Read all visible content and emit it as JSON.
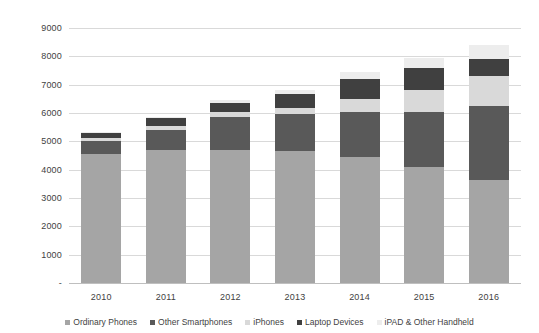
{
  "chart_data": {
    "type": "bar",
    "stacked": true,
    "title": "",
    "subtitle": "",
    "xlabel": "",
    "ylabel": "",
    "categories": [
      "2010",
      "2011",
      "2012",
      "2013",
      "2014",
      "2015",
      "2016"
    ],
    "ylim": [
      0,
      9000
    ],
    "yticks": [
      0,
      1000,
      2000,
      3000,
      4000,
      5000,
      6000,
      7000,
      8000,
      9000
    ],
    "ytick_labels": [
      "-",
      "1000",
      "2000",
      "3000",
      "4000",
      "5000",
      "6000",
      "7000",
      "8000",
      "9000"
    ],
    "grid": true,
    "legend_position": "bottom",
    "series": [
      {
        "name": "Ordinary Phones",
        "color": "#a5a5a5",
        "values": [
          4550,
          4700,
          4700,
          4650,
          4450,
          4100,
          3650
        ]
      },
      {
        "name": "Other Smartphones",
        "color": "#595959",
        "values": [
          450,
          700,
          1150,
          1300,
          1600,
          1950,
          2600
        ]
      },
      {
        "name": "iPhones",
        "color": "#d9d9d9",
        "values": [
          110,
          130,
          200,
          240,
          450,
          750,
          1050
        ]
      },
      {
        "name": "Laptop Devices",
        "color": "#404040",
        "values": [
          180,
          280,
          300,
          480,
          700,
          800,
          600
        ]
      },
      {
        "name": "iPAD & Other Handheld",
        "color": "#ededed",
        "values": [
          30,
          60,
          110,
          160,
          250,
          350,
          500
        ]
      }
    ],
    "totals": [
      5320,
      5870,
      6460,
      6830,
      7450,
      7950,
      8400
    ]
  },
  "legend": {
    "items": [
      {
        "label": "Ordinary Phones",
        "color": "#a5a5a5"
      },
      {
        "label": "Other Smartphones",
        "color": "#595959"
      },
      {
        "label": "iPhones",
        "color": "#d9d9d9"
      },
      {
        "label": "Laptop Devices",
        "color": "#404040"
      },
      {
        "label": "iPAD & Other Handheld",
        "color": "#ededed"
      }
    ]
  }
}
